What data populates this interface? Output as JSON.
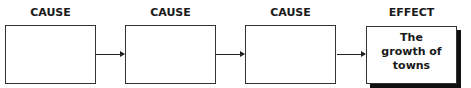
{
  "diagram": {
    "type": "cause-effect chain",
    "nodes": [
      {
        "heading": "CAUSE",
        "content": ""
      },
      {
        "heading": "CAUSE",
        "content": ""
      },
      {
        "heading": "CAUSE",
        "content": ""
      },
      {
        "heading": "EFFECT",
        "content": "The growth of towns"
      }
    ],
    "edges": [
      {
        "from": 0,
        "to": 1
      },
      {
        "from": 1,
        "to": 2
      },
      {
        "from": 2,
        "to": 3
      }
    ]
  }
}
